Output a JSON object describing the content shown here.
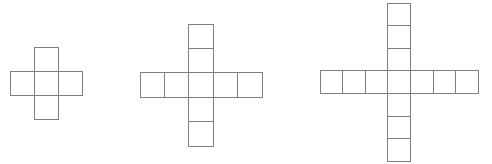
{
  "canvas": {
    "width": 492,
    "height": 164,
    "background": "#ffffff",
    "stroke_color": "#808080",
    "stroke_width": 1,
    "cell_fill": "#ffffff"
  },
  "chart_data": {
    "type": "diagram",
    "title": "",
    "subtitle": "",
    "xlabel": "",
    "ylabel": "",
    "legend": [],
    "annotations": [],
    "grid": false,
    "figures": [
      {
        "name": "cross-1",
        "index": 1,
        "arm_length": 1,
        "square_count": 5,
        "span_cells_x": 3,
        "span_cells_y": 3,
        "cell_size": 24,
        "origin_x": 10,
        "origin_y": 47,
        "horizontal_cells": 3,
        "vertical_cells": 3
      },
      {
        "name": "cross-2",
        "index": 2,
        "arm_length": 2,
        "square_count": 9,
        "span_cells_x": 5,
        "span_cells_y": 5,
        "cell_size": 24.4,
        "origin_x": 140,
        "origin_y": 24,
        "horizontal_cells": 5,
        "vertical_cells": 5
      },
      {
        "name": "cross-3",
        "index": 3,
        "arm_length": 3,
        "square_count": 13,
        "span_cells_x": 7,
        "span_cells_y": 7,
        "cell_size": 22.6,
        "origin_x": 320,
        "origin_y": 3,
        "horizontal_cells": 7,
        "vertical_cells": 7
      }
    ],
    "values": [
      5,
      9,
      13
    ],
    "categories": [
      "cross-1",
      "cross-2",
      "cross-3"
    ]
  }
}
